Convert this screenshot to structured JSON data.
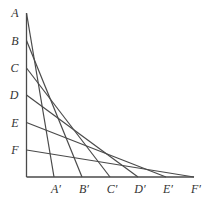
{
  "diagram": {
    "type": "line-envelope (curve stitching)",
    "stroke_color": "#4a4a4a",
    "axis_color": "#4a4a4a",
    "origin": [
      26.5,
      177
    ],
    "vertical_points": [
      {
        "label": "A",
        "x": 26.5,
        "y": 13
      },
      {
        "label": "B",
        "x": 26.5,
        "y": 40.5
      },
      {
        "label": "C",
        "x": 26.5,
        "y": 68
      },
      {
        "label": "D",
        "x": 26.5,
        "y": 95
      },
      {
        "label": "E",
        "x": 26.5,
        "y": 122.5
      },
      {
        "label": "F",
        "x": 26.5,
        "y": 150
      }
    ],
    "horizontal_points": [
      {
        "label": "A′",
        "x": 54,
        "y": 177
      },
      {
        "label": "B′",
        "x": 82,
        "y": 177
      },
      {
        "label": "C′",
        "x": 110,
        "y": 177
      },
      {
        "label": "D′",
        "x": 138,
        "y": 177
      },
      {
        "label": "E′",
        "x": 166,
        "y": 177
      },
      {
        "label": "F′",
        "x": 194,
        "y": 177
      }
    ],
    "segments": [
      [
        "A",
        "A′"
      ],
      [
        "B",
        "B′"
      ],
      [
        "C",
        "C′"
      ],
      [
        "D",
        "D′"
      ],
      [
        "E",
        "E′"
      ],
      [
        "F",
        "F′"
      ]
    ]
  }
}
